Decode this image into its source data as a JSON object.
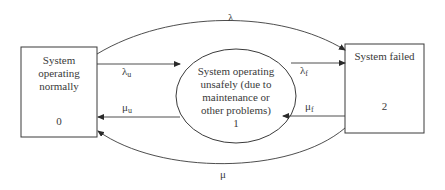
{
  "diagram": {
    "type": "state-transition",
    "nodes": [
      {
        "id": 0,
        "label": "System operating normally",
        "label_lines": [
          "System",
          "operating",
          "normally"
        ],
        "number": "0",
        "shape": "rectangle"
      },
      {
        "id": 1,
        "label": "System operating unsafely (due to maintenance or other problems)",
        "label_lines": [
          "System operating",
          "unsafely (due to",
          "maintenance or",
          "other problems)"
        ],
        "number": "1",
        "shape": "ellipse"
      },
      {
        "id": 2,
        "label": "System failed",
        "label_lines": [
          "System failed"
        ],
        "number": "2",
        "shape": "rectangle"
      }
    ],
    "edges": [
      {
        "from": 0,
        "to": 2,
        "label": "λ",
        "base": "λ",
        "sub": ""
      },
      {
        "from": 0,
        "to": 1,
        "label": "λu",
        "base": "λ",
        "sub": "u"
      },
      {
        "from": 1,
        "to": 0,
        "label": "μu",
        "base": "μ",
        "sub": "u"
      },
      {
        "from": 1,
        "to": 2,
        "label": "λf",
        "base": "λ",
        "sub": "f"
      },
      {
        "from": 2,
        "to": 1,
        "label": "μf",
        "base": "μ",
        "sub": "f"
      },
      {
        "from": 2,
        "to": 0,
        "label": "μ",
        "base": "μ",
        "sub": ""
      }
    ]
  }
}
